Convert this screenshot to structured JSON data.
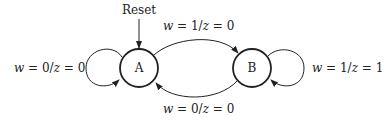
{
  "diagram": {
    "type": "state-machine",
    "reset_label": "Reset",
    "states": [
      {
        "id": "A",
        "label": "A"
      },
      {
        "id": "B",
        "label": "B"
      }
    ],
    "transitions": [
      {
        "from": "A",
        "to": "A",
        "label": "w = 0/z = 0"
      },
      {
        "from": "A",
        "to": "B",
        "label": "w = 1/z = 0"
      },
      {
        "from": "B",
        "to": "A",
        "label": "w = 0/z = 0"
      },
      {
        "from": "B",
        "to": "B",
        "label": "w = 1/z = 1"
      }
    ]
  }
}
